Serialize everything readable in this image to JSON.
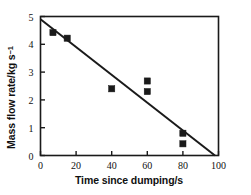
{
  "chart_data": {
    "type": "scatter",
    "title": "",
    "xlabel": "Time since dumping/s",
    "ylabel_main": "Mass flow rate/kg s",
    "ylabel_sup": "−1",
    "ylabel_full": "Mass flow rate/kg s⁻¹",
    "xlim": [
      0,
      100
    ],
    "ylim": [
      0,
      5
    ],
    "xticks": [
      0,
      20,
      40,
      60,
      80,
      100
    ],
    "yticks": [
      0,
      1,
      2,
      3,
      4,
      5
    ],
    "xtick_labels": [
      "0",
      "20",
      "40",
      "60",
      "80",
      "100"
    ],
    "ytick_labels": [
      "0",
      "1",
      "2",
      "3",
      "4",
      "5"
    ],
    "grid": false,
    "legend": false,
    "marker": "filled-square",
    "marker_color": "#1a1a1a",
    "line_color": "#1a1a1a",
    "frame_color": "#1a1a1a",
    "background": "#ffffff",
    "series": [
      {
        "name": "Measured mass flow rate",
        "type": "scatter",
        "points": [
          {
            "x": 7,
            "y": 4.42
          },
          {
            "x": 15,
            "y": 4.22
          },
          {
            "x": 40,
            "y": 2.4
          },
          {
            "x": 60,
            "y": 2.68
          },
          {
            "x": 60,
            "y": 2.3
          },
          {
            "x": 80,
            "y": 0.8
          },
          {
            "x": 80,
            "y": 0.42
          }
        ]
      },
      {
        "name": "Linear fit",
        "type": "line",
        "points": [
          {
            "x": 0,
            "y": 4.9
          },
          {
            "x": 98,
            "y": 0.0
          }
        ]
      }
    ]
  },
  "axes": {
    "x_title": "Time since dumping/s",
    "y_title_text": "Mass flow rate/kg s",
    "y_title_sup": "−1"
  }
}
